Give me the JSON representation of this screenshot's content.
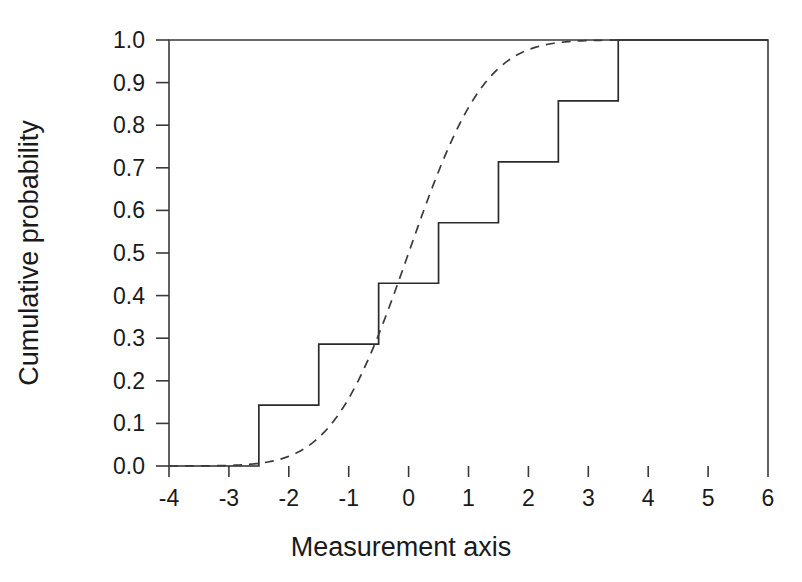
{
  "chart_data": {
    "type": "line",
    "title": "",
    "subtitle": "",
    "xlabel": "Measurement axis",
    "ylabel": "Cumulative probability",
    "xlim": [
      -4,
      6
    ],
    "ylim": [
      0.0,
      1.0
    ],
    "grid": false,
    "legend": "none",
    "xticks": [
      -4,
      -3,
      -2,
      -1,
      0,
      1,
      2,
      3,
      4,
      5,
      6
    ],
    "xtick_labels": [
      "-4",
      "-3",
      "-2",
      "-1",
      "0",
      "1",
      "2",
      "3",
      "4",
      "5",
      "6"
    ],
    "yticks": [
      0.0,
      0.1,
      0.2,
      0.3,
      0.4,
      0.5,
      0.6,
      0.7,
      0.8,
      0.9,
      1.0
    ],
    "ytick_labels": [
      "0.0",
      "0.1",
      "0.2",
      "0.3",
      "0.4",
      "0.5",
      "0.6",
      "0.7",
      "0.8",
      "0.9",
      "1.0"
    ],
    "series": [
      {
        "name": "Empirical cumulative distribution (step)",
        "style": "solid-step",
        "color": "#2b2b2b",
        "jump_x": [
          -2.5,
          -1.5,
          -0.5,
          0.5,
          1.5,
          2.5,
          3.5
        ],
        "jump_y": [
          0.143,
          0.286,
          0.429,
          0.571,
          0.714,
          0.857,
          1.0
        ],
        "x": [
          -4,
          -2.5,
          -2.5,
          -1.5,
          -1.5,
          -0.5,
          -0.5,
          0.5,
          0.5,
          1.5,
          1.5,
          2.5,
          2.5,
          3.5,
          3.5,
          6
        ],
        "values": [
          0.0,
          0.0,
          0.143,
          0.143,
          0.286,
          0.286,
          0.429,
          0.429,
          0.571,
          0.571,
          0.714,
          0.714,
          0.857,
          0.857,
          1.0,
          1.0
        ]
      },
      {
        "name": "Theoretical normal cumulative distribution (dashed)",
        "style": "dashed-curve",
        "color": "#3a3a3a",
        "distribution": "normal",
        "mean": 0,
        "sd": 1,
        "x": [
          -4.0,
          -3.5,
          -3.0,
          -2.5,
          -2.0,
          -1.75,
          -1.5,
          -1.25,
          -1.0,
          -0.75,
          -0.5,
          -0.25,
          0.0,
          0.25,
          0.5,
          0.75,
          1.0,
          1.25,
          1.5,
          1.75,
          2.0,
          2.5,
          3.0,
          3.5,
          4.0,
          5.0,
          6.0
        ],
        "values": [
          0.0,
          0.0002,
          0.0013,
          0.0062,
          0.0228,
          0.0401,
          0.0668,
          0.1056,
          0.1587,
          0.2266,
          0.3085,
          0.4013,
          0.5,
          0.5987,
          0.6915,
          0.7734,
          0.8413,
          0.8944,
          0.9332,
          0.9599,
          0.9772,
          0.9938,
          0.9987,
          0.9998,
          1.0,
          1.0,
          1.0
        ]
      }
    ]
  }
}
